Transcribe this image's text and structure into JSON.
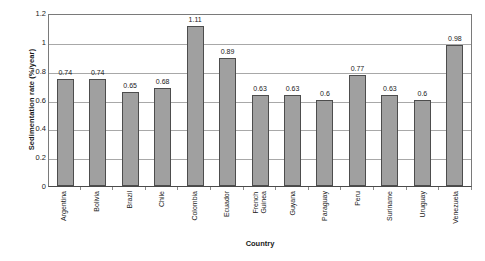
{
  "chart_data": {
    "type": "bar",
    "title": "",
    "xlabel": "Country",
    "ylabel": "Sedimentation rate (%/year)",
    "categories": [
      "Argentina",
      "Bolivia",
      "Brazil",
      "Chile",
      "Colombia",
      "Ecuador",
      "French Guinea",
      "Guyana",
      "Paraguay",
      "Peru",
      "Suriname",
      "Uruguay",
      "Venezuela"
    ],
    "category_lines": [
      [
        "Argentina"
      ],
      [
        "Bolivia"
      ],
      [
        "Brazil"
      ],
      [
        "Chile"
      ],
      [
        "Colombia"
      ],
      [
        "Ecuador"
      ],
      [
        "French",
        "Guinea"
      ],
      [
        "Guyana"
      ],
      [
        "Paraguay"
      ],
      [
        "Peru"
      ],
      [
        "Suriname"
      ],
      [
        "Uruguay"
      ],
      [
        "Venezuela"
      ]
    ],
    "values": [
      0.74,
      0.74,
      0.65,
      0.68,
      1.11,
      0.89,
      0.63,
      0.63,
      0.6,
      0.77,
      0.63,
      0.6,
      0.98
    ],
    "value_labels": [
      "0.74",
      "0.74",
      "0.65",
      "0.68",
      "1.11",
      "0.89",
      "0.63",
      "0.63",
      "0.6",
      "0.77",
      "0.63",
      "0.6",
      "0.98"
    ],
    "ylim": [
      0,
      1.2
    ],
    "ytick_values": [
      0,
      0.2,
      0.4,
      0.6,
      0.8,
      1,
      1.2
    ],
    "ytick_labels": [
      "0",
      "0.2",
      "0.4",
      "0.6",
      "0.8",
      "1",
      "1.2"
    ],
    "grid": true,
    "grid_axis": "y",
    "legend": "none",
    "bar_color": "#a0a0a0",
    "bar_border_color": "#4d4d4d",
    "gridline_color": "#a8a8a8",
    "axis_color": "#4a4a4a",
    "background_color": "#ffffff",
    "text_color": "#1a1a1a",
    "data_labels_shown": true
  }
}
